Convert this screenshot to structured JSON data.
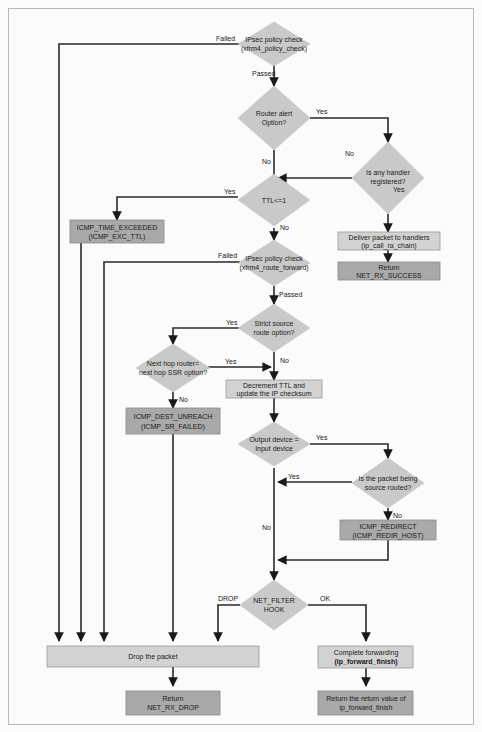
{
  "diagram": {
    "nodes": {
      "policy_check": {
        "line1": "IPsec policy check",
        "line2": "(xfrm4_policy_check)"
      },
      "router_alert": {
        "line1": "Router alert",
        "line2": "Option?"
      },
      "any_handler": {
        "line1": "Is any handler",
        "line2": "registered?"
      },
      "deliver": {
        "line1": "Deliver packet to handlers",
        "line2": "(ip_call_ra_chain)"
      },
      "return_success": {
        "line1": "Return",
        "line2": "NET_RX_SUCCESS"
      },
      "ttl": {
        "line1": "TTL<=1"
      },
      "icmp_time_exceeded": {
        "line1": "ICMP_TIME_EXCEEDED",
        "line2": "(ICMP_EXC_TTL)"
      },
      "route_forward": {
        "line1": "IPsec policy check",
        "line2": "(xfrm4_route_forward)"
      },
      "strict_source": {
        "line1": "Strict source",
        "line2": "route option?"
      },
      "next_hop": {
        "line1": "Next hop router=",
        "line2": "next hop SSR option?"
      },
      "icmp_dest_unreach": {
        "line1": "ICMP_DEST_UNREACH",
        "line2": "(ICMP_SR_FAILED)"
      },
      "decrement_ttl": {
        "line1": "Decrement TTL and",
        "line2": "update the IP checksum"
      },
      "output_device": {
        "line1": "Output device =",
        "line2": "Input device"
      },
      "source_routed": {
        "line1": "Is the packet being",
        "line2": "source routed?"
      },
      "icmp_redirect": {
        "line1": "ICMP_REDIRECT",
        "line2": "(ICMP_REDIR_HOST)"
      },
      "net_filter": {
        "line1": "NET_FILTER",
        "line2": "HOOK"
      },
      "drop": {
        "line1": "Drop the packet"
      },
      "return_drop": {
        "line1": "Return",
        "line2": "NET_RX_DROP"
      },
      "complete_forwarding": {
        "line1": "Complete forwarding",
        "line2": "(ip_forward_finish)"
      },
      "return_value": {
        "line1": "Return the return value of",
        "line2": "ip_forward_finish"
      }
    },
    "edge_labels": {
      "policy_failed": "Failed",
      "policy_passed": "Passed",
      "router_alert_yes": "Yes",
      "any_handler_no": "No",
      "any_handler_yes": "Yes",
      "router_alert_no": "No",
      "ttl_yes": "Yes",
      "ttl_no": "No",
      "route_forward_failed": "Failed",
      "route_forward_passed": "Passed",
      "strict_yes": "Yes",
      "strict_no": "No",
      "next_hop_yes": "Yes",
      "next_hop_no": "No",
      "output_yes": "Yes",
      "source_routed_yes": "Yes",
      "source_routed_no": "No",
      "output_no": "No",
      "filter_drop": "DROP",
      "filter_ok": "OK"
    }
  }
}
